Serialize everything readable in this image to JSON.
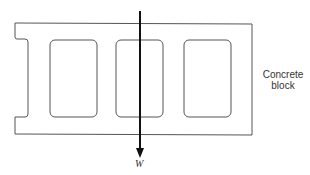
{
  "diagram": {
    "block_label_line1": "Concrete",
    "block_label_line2": "block",
    "force_label": "W",
    "colors": {
      "outline": "#555555",
      "arrow": "#111111",
      "text": "#333333"
    }
  }
}
